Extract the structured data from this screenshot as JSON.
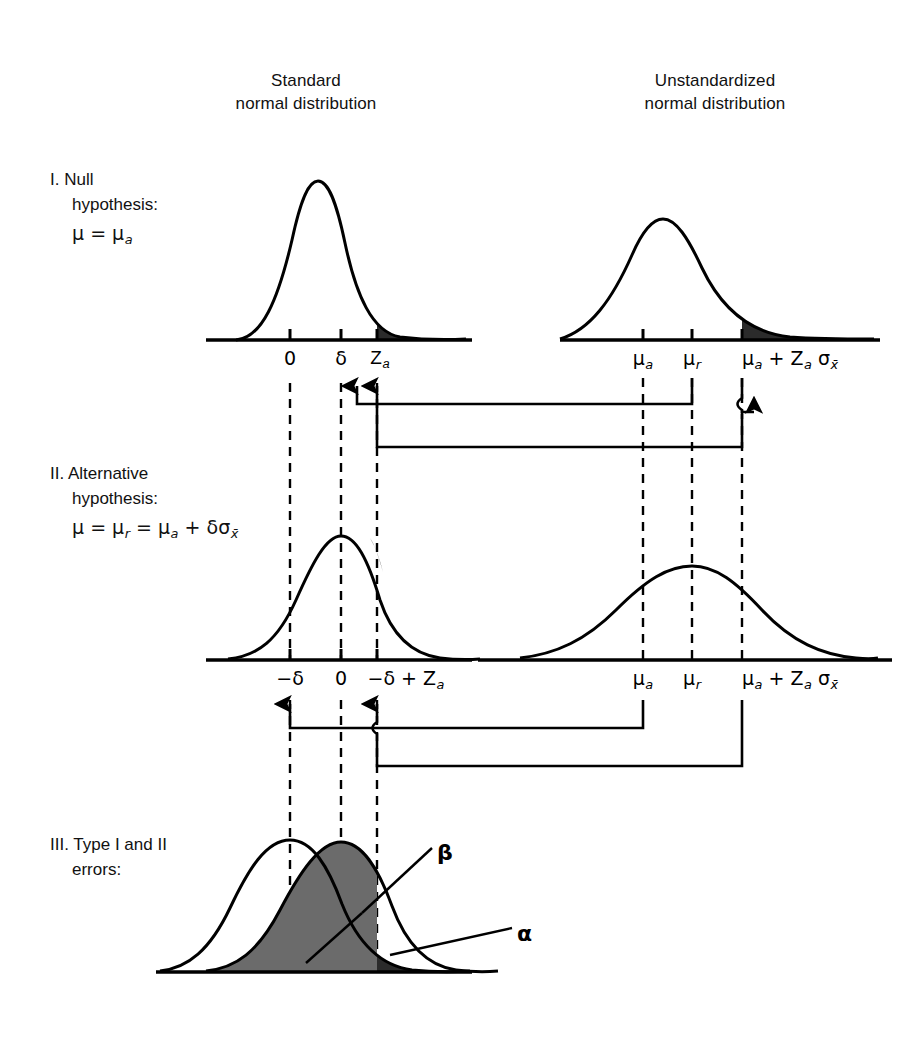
{
  "figure": {
    "background": "#ffffff",
    "ink": "#000000",
    "shade_alpha": "#2b2b2b",
    "shade_beta": "#6b6b6b"
  },
  "columns": [
    {
      "id": "standard",
      "label": "Standard\nnormal distribution"
    },
    {
      "id": "unstandardized",
      "label": "Unstandardized\nnormal distribution"
    }
  ],
  "rows": [
    {
      "id": "i",
      "number": "I.",
      "title_line1": "Null",
      "title_line2": "hypothesis:",
      "formula_html": "μ = μ<sub>a</sub>"
    },
    {
      "id": "ii",
      "number": "II.",
      "title_line1": "Alternative",
      "title_line2": "hypothesis:",
      "formula_html": "μ = μ<sub>r</sub> = μ<sub>a</sub> + δσ<sub>x̄</sub>"
    },
    {
      "id": "iii",
      "number": "III.",
      "title_line1": "Type I and II",
      "title_line2": "errors:",
      "formula_html": ""
    }
  ],
  "axis_labels": {
    "row_i_left": [
      "0",
      "δ",
      "Z<sub>a</sub>"
    ],
    "row_i_right": [
      "μ<sub>a</sub>",
      "μ<sub>r</sub>",
      "μ<sub>a</sub> + Z<sub>a</sub> σ<sub>x̄</sub>"
    ],
    "row_ii_left": [
      "−δ",
      "0",
      "−δ + Z<sub>a</sub>"
    ],
    "row_ii_right": [
      "μ<sub>a</sub>",
      "μ<sub>r</sub>",
      "μ<sub>a</sub> + Z<sub>a</sub> σ<sub>x̄</sub>"
    ]
  },
  "annotations": [
    {
      "id": "beta",
      "symbol": "β",
      "meaning": "Type II error probability (shaded overlap region)"
    },
    {
      "id": "alpha",
      "symbol": "α",
      "meaning": "Type I error probability (shaded right tail)"
    }
  ],
  "chart_data": {
    "type": "line",
    "panels": [
      {
        "id": "row-i-standard",
        "row": "I. Null hypothesis",
        "column": "Standard normal distribution",
        "curve": {
          "mean": 0,
          "sd": 1,
          "peak_label": "0"
        },
        "ticks": [
          {
            "label": "0",
            "x": 0
          },
          {
            "label": "δ",
            "x": 1.0
          },
          {
            "label": "Z_a",
            "x": 1.65
          }
        ],
        "shaded": [
          {
            "name": "alpha-tail",
            "from": "Z_a",
            "to": "+inf",
            "fill": "#2b2b2b"
          }
        ]
      },
      {
        "id": "row-i-unstandardized",
        "row": "I. Null hypothesis",
        "column": "Unstandardized normal distribution",
        "curve": {
          "mean": "mu_a",
          "sd": "sigma_xbar",
          "peak_label": "μ_a"
        },
        "ticks": [
          {
            "label": "μ_a",
            "x": 0
          },
          {
            "label": "μ_r",
            "x": 1.0
          },
          {
            "label": "μ_a + Z_a σ_x̄",
            "x": 1.65
          }
        ],
        "shaded": [
          {
            "name": "alpha-tail",
            "from": "μ_a + Z_a σ_x̄",
            "to": "+inf",
            "fill": "#2b2b2b"
          }
        ]
      },
      {
        "id": "row-ii-standard",
        "row": "II. Alternative hypothesis",
        "column": "Standard normal distribution",
        "curve": {
          "mean": 0,
          "sd": 1,
          "peak_label": "0"
        },
        "ticks": [
          {
            "label": "−δ",
            "x": -1.0
          },
          {
            "label": "0",
            "x": 0
          },
          {
            "label": "−δ + Z_a",
            "x": 0.65
          }
        ],
        "shaded": []
      },
      {
        "id": "row-ii-unstandardized",
        "row": "II. Alternative hypothesis",
        "column": "Unstandardized normal distribution",
        "curve": {
          "mean": "mu_r",
          "sd": "sigma_xbar",
          "peak_label": "μ_r"
        },
        "ticks": [
          {
            "label": "μ_a",
            "x": -1.0
          },
          {
            "label": "μ_r",
            "x": 0
          },
          {
            "label": "μ_a + Z_a σ_x̄",
            "x": 0.65
          }
        ],
        "shaded": []
      },
      {
        "id": "row-iii-errors",
        "row": "III. Type I and II errors",
        "column": "Standard normal distribution",
        "curves": [
          {
            "name": "null-distribution",
            "mean": -1.0,
            "sd": 1,
            "peak_label": "−δ"
          },
          {
            "name": "alternative-distribution",
            "mean": 0,
            "sd": 1,
            "peak_label": "0"
          }
        ],
        "shaded": [
          {
            "name": "beta-region",
            "symbol": "β",
            "from": "-inf",
            "to": "−δ + Z_a",
            "fill": "#6b6b6b"
          },
          {
            "name": "alpha-region",
            "symbol": "α",
            "from": "−δ + Z_a",
            "to": "+inf",
            "fill": "#2b2b2b"
          }
        ]
      }
    ],
    "connectors": [
      {
        "from": "row-i-unstandardized:μ_r",
        "to": "row-ii-standard:0",
        "style": "arrow-up"
      },
      {
        "from": "row-i-unstandardized:μ_a + Z_a σ_x̄",
        "to": "row-ii-standard:−δ + Z_a",
        "style": "arrow-up"
      },
      {
        "from": "row-ii-unstandardized:μ_a",
        "to": "row-iii-errors:−δ",
        "style": "arrow-up"
      },
      {
        "from": "row-ii-unstandardized:μ_a + Z_a σ_x̄",
        "to": "row-iii-errors:−δ + Z_a",
        "style": "arrow-up"
      }
    ],
    "grid": false,
    "legend": "none"
  }
}
